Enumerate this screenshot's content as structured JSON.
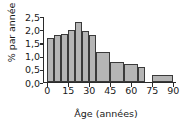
{
  "chart_data": {
    "type": "bar",
    "title": "",
    "subtitle": "",
    "xlabel": "Âge (années)",
    "ylabel": "% par année",
    "xlim": [
      -3,
      92
    ],
    "ylim": [
      0,
      2.5
    ],
    "grid": false,
    "legend": null,
    "bar_color": "#b5b5b5",
    "bar_edge_color": "#3a3a3a",
    "axis_color": "#2b2b2b",
    "text_color": "#1a1a1a",
    "xticks": [
      0,
      15,
      30,
      45,
      60,
      75,
      90
    ],
    "xticklabels": [
      "0",
      "15",
      "30",
      "45",
      "60",
      "75",
      "90"
    ],
    "yticks": [
      0.0,
      0.5,
      1.0,
      1.5,
      2.0,
      2.5
    ],
    "yticklabels": [
      "0,0",
      "0,5",
      "1,0",
      "1,5",
      "2,0",
      "2,5"
    ],
    "categories": [
      "0-5",
      "5-10",
      "10-15",
      "15-20",
      "20-25",
      "25-30",
      "30-35",
      "35-45",
      "45-55",
      "55-65",
      "65-70",
      "75-90"
    ],
    "bin_edges": [
      [
        0,
        5
      ],
      [
        5,
        10
      ],
      [
        10,
        15
      ],
      [
        15,
        20
      ],
      [
        20,
        25
      ],
      [
        25,
        30
      ],
      [
        30,
        35
      ],
      [
        35,
        45
      ],
      [
        45,
        55
      ],
      [
        55,
        65
      ],
      [
        65,
        70
      ],
      [
        75,
        90
      ]
    ],
    "values": [
      1.7,
      1.8,
      1.85,
      2.0,
      2.3,
      1.95,
      1.8,
      1.15,
      0.77,
      0.68,
      0.55,
      0.27
    ],
    "annotations": []
  }
}
